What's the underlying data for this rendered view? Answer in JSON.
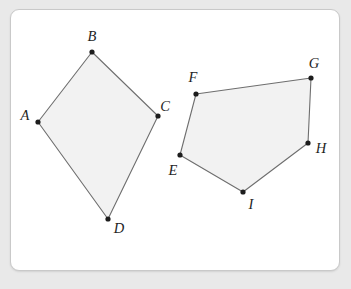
{
  "canvas": {
    "width": 351,
    "height": 289,
    "background_color": "#e9e9e9"
  },
  "card": {
    "background_color": "#ffffff",
    "border_color": "#c9c9c9",
    "corner_radius": 9
  },
  "style": {
    "shape_fill_color": "#f2f2f2",
    "shape_stroke_color": "#6e6e6e",
    "vertex_dot_color": "#1d1d1d",
    "label_color": "#1f1f1f"
  },
  "chart_data": {
    "type": "scatter",
    "title": "",
    "xlabel": "",
    "ylabel": "",
    "shapes": [
      {
        "name": "quadrilateral-abcd",
        "kind": "quadrilateral",
        "vertex_labels": [
          "A",
          "B",
          "C",
          "D"
        ],
        "points": [
          [
            38,
            122
          ],
          [
            92,
            52
          ],
          [
            158,
            116
          ],
          [
            108,
            219
          ]
        ]
      },
      {
        "name": "pentagon-efghi",
        "kind": "pentagon",
        "vertex_labels": [
          "E",
          "F",
          "G",
          "H",
          "I"
        ],
        "points": [
          [
            180,
            155
          ],
          [
            196,
            94
          ],
          [
            311,
            78
          ],
          [
            308,
            143
          ],
          [
            243,
            192
          ]
        ]
      }
    ],
    "vertices": [
      {
        "label": "A",
        "x": 38,
        "y": 122,
        "label_x": 25,
        "label_y": 120,
        "anchor": "middle"
      },
      {
        "label": "B",
        "x": 92,
        "y": 52,
        "label_x": 92,
        "label_y": 41,
        "anchor": "middle"
      },
      {
        "label": "C",
        "x": 158,
        "y": 116,
        "label_x": 165,
        "label_y": 111,
        "anchor": "middle"
      },
      {
        "label": "D",
        "x": 108,
        "y": 219,
        "label_x": 119,
        "label_y": 233,
        "anchor": "middle"
      },
      {
        "label": "E",
        "x": 180,
        "y": 155,
        "label_x": 173,
        "label_y": 175,
        "anchor": "middle"
      },
      {
        "label": "F",
        "x": 196,
        "y": 94,
        "label_x": 193,
        "label_y": 82,
        "anchor": "middle"
      },
      {
        "label": "G",
        "x": 311,
        "y": 78,
        "label_x": 314,
        "label_y": 68,
        "anchor": "middle"
      },
      {
        "label": "H",
        "x": 308,
        "y": 143,
        "label_x": 321,
        "label_y": 153,
        "anchor": "middle"
      },
      {
        "label": "I",
        "x": 243,
        "y": 192,
        "label_x": 251,
        "label_y": 209,
        "anchor": "middle"
      }
    ],
    "grid": false,
    "legend": "none"
  }
}
